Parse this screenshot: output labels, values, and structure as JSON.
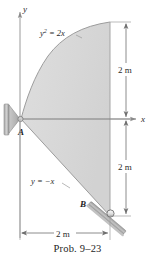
{
  "figure": {
    "caption": "Prob. 9–23",
    "axes": {
      "y_label": "y",
      "x_label": "x"
    },
    "curve_labels": {
      "parabola": "y² = 2x",
      "parabola_base": "y",
      "parabola_exp": "2",
      "parabola_rest": " = 2x",
      "line": "y = −x"
    },
    "points": {
      "a": "A",
      "b": "B"
    },
    "dimensions": {
      "upper_vertical": "2 m",
      "lower_vertical": "2 m",
      "horizontal": "2 m"
    },
    "colors": {
      "region_fill": "#d8d8d8",
      "outline": "#8a8a8a",
      "axis": "#9a9a9a",
      "text": "#1d1d1d",
      "support": "#b0b0b0",
      "support_dark": "#8f8f8f",
      "background": "#ffffff"
    }
  }
}
